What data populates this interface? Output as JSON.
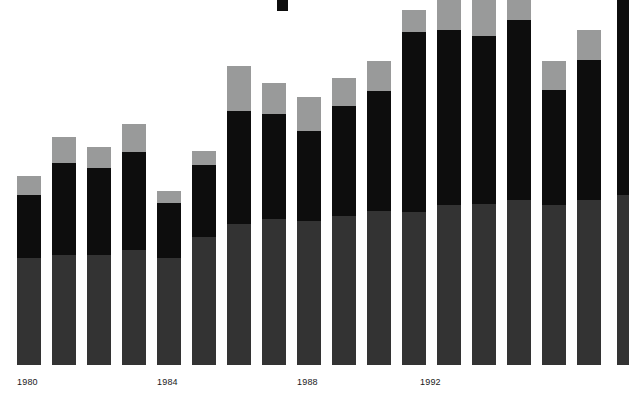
{
  "chart_data": {
    "type": "bar",
    "subtype": "stacked-bar",
    "title": "",
    "subtitle": "",
    "xlabel": "",
    "ylabel": "",
    "grid": false,
    "legend_position": "none",
    "axis": {
      "baseline_y": 365,
      "tick_labels": [
        "1980",
        "1984",
        "1988",
        "1992"
      ],
      "tick_label_x": [
        17,
        157,
        297,
        420
      ],
      "x_label_only_every": 4
    },
    "colors": {
      "top": "#999a9a",
      "middle": "#0d0d0d",
      "bottom": "#333333",
      "background": "#ffffff",
      "label_text": "#1a1a1a"
    },
    "series": [
      {
        "name": "bottom-segment",
        "color": "#333333",
        "values": [
          107,
          110,
          110,
          115,
          107,
          128,
          141,
          146,
          144,
          149,
          154,
          153,
          160,
          161,
          165,
          160,
          165,
          170
        ]
      },
      {
        "name": "middle-segment",
        "color": "#0d0d0d",
        "values": [
          63,
          92,
          87,
          98,
          55,
          72,
          113,
          105,
          90,
          110,
          120,
          180,
          175,
          168,
          180,
          115,
          140,
          195
        ]
      },
      {
        "name": "top-segment",
        "color": "#999a9a",
        "values": [
          19,
          26,
          21,
          28,
          12,
          14,
          45,
          31,
          34,
          28,
          30,
          22,
          33,
          40,
          30,
          29,
          30,
          25
        ]
      }
    ],
    "bars": [
      {
        "index": 0,
        "x": 17,
        "width": 24,
        "bottom_h": 107,
        "middle_h": 63,
        "top_h": 19,
        "total_h": 189,
        "clipped_top": false
      },
      {
        "index": 1,
        "x": 52,
        "width": 24,
        "bottom_h": 110,
        "middle_h": 92,
        "top_h": 26,
        "total_h": 228,
        "clipped_top": false
      },
      {
        "index": 2,
        "x": 87,
        "width": 24,
        "bottom_h": 110,
        "middle_h": 87,
        "top_h": 21,
        "total_h": 218,
        "clipped_top": false
      },
      {
        "index": 3,
        "x": 122,
        "width": 24,
        "bottom_h": 115,
        "middle_h": 98,
        "top_h": 28,
        "total_h": 241,
        "clipped_top": false
      },
      {
        "index": 4,
        "x": 157,
        "width": 24,
        "bottom_h": 107,
        "middle_h": 55,
        "top_h": 12,
        "total_h": 174,
        "clipped_top": false
      },
      {
        "index": 5,
        "x": 192,
        "width": 24,
        "bottom_h": 128,
        "middle_h": 72,
        "top_h": 14,
        "total_h": 214,
        "clipped_top": false
      },
      {
        "index": 6,
        "x": 227,
        "width": 24,
        "bottom_h": 141,
        "middle_h": 113,
        "top_h": 45,
        "total_h": 299,
        "clipped_top": false
      },
      {
        "index": 7,
        "x": 262,
        "width": 24,
        "bottom_h": 146,
        "middle_h": 105,
        "top_h": 31,
        "total_h": 282,
        "clipped_top": false
      },
      {
        "index": 8,
        "x": 297,
        "width": 24,
        "bottom_h": 144,
        "middle_h": 90,
        "top_h": 34,
        "total_h": 268,
        "clipped_top": false
      },
      {
        "index": 9,
        "x": 332,
        "width": 24,
        "bottom_h": 149,
        "middle_h": 110,
        "top_h": 28,
        "total_h": 287,
        "clipped_top": false
      },
      {
        "index": 10,
        "x": 367,
        "width": 24,
        "bottom_h": 154,
        "middle_h": 120,
        "top_h": 30,
        "total_h": 304,
        "clipped_top": false
      },
      {
        "index": 11,
        "x": 402,
        "width": 24,
        "bottom_h": 153,
        "middle_h": 180,
        "top_h": 22,
        "total_h": 355,
        "clipped_top": false
      },
      {
        "index": 12,
        "x": 437,
        "width": 24,
        "bottom_h": 160,
        "middle_h": 175,
        "top_h": 33,
        "total_h": 368,
        "clipped_top": true
      },
      {
        "index": 13,
        "x": 472,
        "width": 24,
        "bottom_h": 161,
        "middle_h": 168,
        "top_h": 40,
        "total_h": 369,
        "clipped_top": true
      },
      {
        "index": 14,
        "x": 507,
        "width": 24,
        "bottom_h": 165,
        "middle_h": 180,
        "top_h": 30,
        "total_h": 375,
        "clipped_top": true
      },
      {
        "index": 15,
        "x": 542,
        "width": 24,
        "bottom_h": 160,
        "middle_h": 115,
        "top_h": 29,
        "total_h": 304,
        "clipped_top": false
      },
      {
        "index": 16,
        "x": 577,
        "width": 24,
        "bottom_h": 165,
        "middle_h": 140,
        "top_h": 30,
        "total_h": 335,
        "clipped_top": false
      },
      {
        "index": 17,
        "x": 617,
        "width": 12,
        "bottom_h": 170,
        "middle_h": 195,
        "top_h": 25,
        "total_h": 390,
        "clipped_top": true,
        "clipped_right": true
      }
    ],
    "top_marker": {
      "x": 277,
      "y": 0,
      "width": 11,
      "height": 11,
      "color": "#0d0d0d"
    }
  }
}
